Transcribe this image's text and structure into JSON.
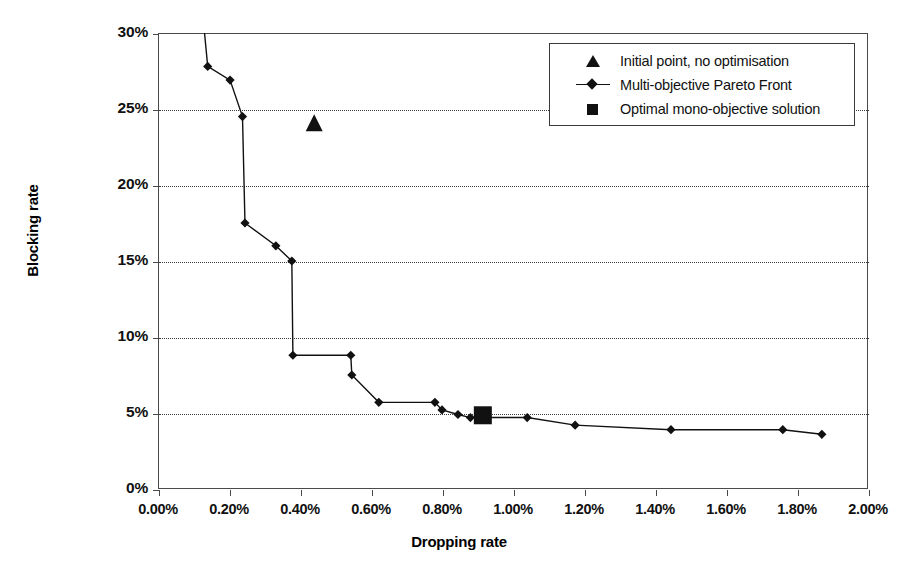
{
  "chart_data": {
    "type": "line",
    "title": "",
    "xlabel": "Dropping rate",
    "ylabel": "Blocking rate",
    "xlim": [
      0,
      2.0
    ],
    "ylim": [
      0,
      30
    ],
    "grid": true,
    "x_tick_labels": [
      "0.00%",
      "0.20%",
      "0.40%",
      "0.60%",
      "0.80%",
      "1.00%",
      "1.20%",
      "1.40%",
      "1.60%",
      "1.80%",
      "2.00%"
    ],
    "x_tick_values": [
      0.0,
      0.2,
      0.4,
      0.6,
      0.8,
      1.0,
      1.2,
      1.4,
      1.6,
      1.8,
      2.0
    ],
    "y_tick_labels": [
      "0%",
      "5%",
      "10%",
      "15%",
      "20%",
      "25%",
      "30%"
    ],
    "y_tick_values": [
      0,
      5,
      10,
      15,
      20,
      25,
      30
    ],
    "legend_position": "top-right",
    "series": [
      {
        "name": "Initial point, no optimisation",
        "type": "scatter",
        "marker": "triangle",
        "color": "#111111",
        "points": [
          [
            0.44,
            24.1
          ]
        ]
      },
      {
        "name": "Multi-objective Pareto Front",
        "type": "line",
        "marker": "diamond",
        "color": "#111111",
        "points": [
          [
            0.125,
            31.5
          ],
          [
            0.14,
            27.8
          ],
          [
            0.203,
            26.9
          ],
          [
            0.238,
            24.5
          ],
          [
            0.245,
            17.5
          ],
          [
            0.332,
            16.0
          ],
          [
            0.377,
            15.0
          ],
          [
            0.38,
            8.8
          ],
          [
            0.543,
            8.8
          ],
          [
            0.546,
            7.5
          ],
          [
            0.622,
            5.7
          ],
          [
            0.78,
            5.7
          ],
          [
            0.8,
            5.2
          ],
          [
            0.845,
            4.9
          ],
          [
            0.88,
            4.7
          ],
          [
            1.04,
            4.7
          ],
          [
            1.175,
            4.2
          ],
          [
            1.445,
            3.9
          ],
          [
            1.76,
            3.9
          ],
          [
            1.87,
            3.6
          ]
        ]
      },
      {
        "name": "Optimal mono-objective solution",
        "type": "scatter",
        "marker": "square",
        "color": "#111111",
        "points": [
          [
            0.915,
            4.85
          ]
        ]
      }
    ]
  },
  "axes": {
    "x_title": "Dropping rate",
    "y_title": "Blocking rate"
  },
  "legend": {
    "items": [
      {
        "label": "Initial point, no optimisation",
        "marker": "triangle"
      },
      {
        "label": "Multi-objective Pareto Front",
        "marker": "line-diamond"
      },
      {
        "label": "Optimal mono-objective solution",
        "marker": "square"
      }
    ]
  }
}
